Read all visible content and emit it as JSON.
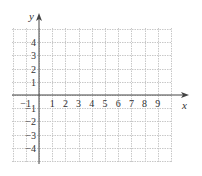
{
  "chart_data": {
    "type": "scatter",
    "title": "",
    "xlabel": "x",
    "ylabel": "y",
    "xlim": [
      -2,
      11
    ],
    "ylim": [
      -5,
      5
    ],
    "grid": true,
    "x_ticks": [
      "-1",
      "1",
      "2",
      "3",
      "4",
      "5",
      "6",
      "7",
      "8",
      "9"
    ],
    "y_ticks": [
      "4",
      "3",
      "2",
      "1",
      "-1",
      "-2",
      "-3",
      "-4"
    ],
    "series": []
  },
  "colors": {
    "grid": "#c8c8c8",
    "axis": "#444444",
    "text": "#333333"
  }
}
